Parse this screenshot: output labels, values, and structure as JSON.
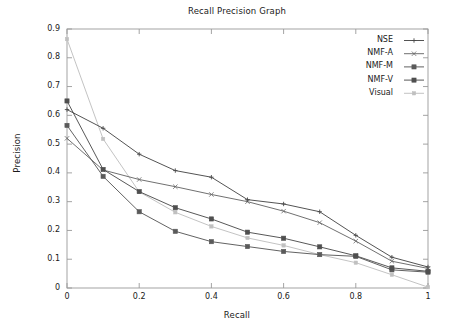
{
  "chart_data": {
    "type": "line",
    "title": "Recall Precision Graph",
    "xlabel": "Recall",
    "ylabel": "Precision",
    "xlim": [
      0,
      1
    ],
    "ylim": [
      0,
      0.9
    ],
    "xticks": [
      "0",
      "0.2",
      "0.4",
      "0.6",
      "0.8",
      "1"
    ],
    "xtick_values": [
      0,
      0.2,
      0.4,
      0.6,
      0.8,
      1
    ],
    "yticks": [
      "0",
      "0.1",
      "0.2",
      "0.3",
      "0.4",
      "0.5",
      "0.6",
      "0.7",
      "0.8",
      "0.9"
    ],
    "ytick_values": [
      0,
      0.1,
      0.2,
      0.3,
      0.4,
      0.5,
      0.6,
      0.7,
      0.8,
      0.9
    ],
    "grid": false,
    "legend_position": "top-right",
    "x": [
      0,
      0.1,
      0.2,
      0.3,
      0.4,
      0.5,
      0.6,
      0.7,
      0.8,
      0.9,
      1
    ],
    "series": [
      {
        "name": "NSE",
        "marker": "plus",
        "color": "#4a4a4a",
        "values": [
          0.62,
          0.555,
          0.465,
          0.408,
          0.385,
          0.307,
          0.292,
          0.265,
          0.183,
          0.107,
          0.073
        ]
      },
      {
        "name": "NMF-A",
        "marker": "cross",
        "color": "#686868",
        "values": [
          0.52,
          0.41,
          0.377,
          0.352,
          0.325,
          0.3,
          0.267,
          0.227,
          0.163,
          0.093,
          0.068
        ]
      },
      {
        "name": "NMF-M",
        "marker": "filled-square",
        "color": "#5a5a5a",
        "values": [
          0.565,
          0.388,
          0.265,
          0.197,
          0.161,
          0.144,
          0.127,
          0.116,
          0.11,
          0.063,
          0.055
        ]
      },
      {
        "name": "NMF-V",
        "marker": "square",
        "color": "#4f4f4f",
        "values": [
          0.65,
          0.412,
          0.335,
          0.279,
          0.24,
          0.194,
          0.173,
          0.143,
          0.112,
          0.07,
          0.058
        ]
      },
      {
        "name": "Visual",
        "marker": "dot",
        "color": "#c0c0c0",
        "values": [
          0.865,
          0.518,
          0.334,
          0.263,
          0.214,
          0.174,
          0.148,
          0.116,
          0.088,
          0.046,
          0.003
        ]
      }
    ]
  },
  "axis": {
    "frame_color": "#9a9a9a",
    "tick_color": "#9a9a9a"
  }
}
